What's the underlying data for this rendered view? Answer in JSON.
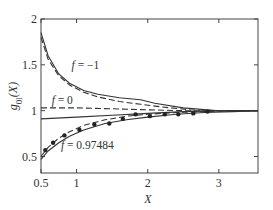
{
  "chart_data": {
    "type": "line",
    "title": "",
    "xlabel": "X",
    "ylabel": "g_{0l}(X)",
    "xlim": [
      0.5,
      3.55
    ],
    "ylim": [
      0.32,
      2.0
    ],
    "xticks": [
      0.5,
      1,
      2,
      3
    ],
    "xtick_labels": [
      "0.5",
      "1",
      "2",
      "3"
    ],
    "yticks": [
      0.5,
      1,
      1.5,
      2
    ],
    "ytick_labels": [
      "0.5",
      "1",
      "1.5",
      "2"
    ],
    "grid": false,
    "legend": "none",
    "annotations": [
      {
        "text": "f = −1",
        "x": 0.93,
        "y": 1.45
      },
      {
        "text": "f = 0",
        "x": 0.65,
        "y": 1.07
      },
      {
        "text": "f = 0.97484",
        "x": 0.78,
        "y": 0.58
      }
    ],
    "series": [
      {
        "name": "f=-1 solid",
        "style": "solid",
        "x": [
          0.5,
          0.6,
          0.75,
          0.9,
          1.1,
          1.3,
          1.6,
          1.9,
          2.1,
          2.5,
          3.0,
          3.55
        ],
        "y": [
          1.85,
          1.6,
          1.4,
          1.3,
          1.22,
          1.18,
          1.14,
          1.12,
          1.08,
          1.03,
          1.0,
          1.0
        ]
      },
      {
        "name": "f=-1 dashed",
        "style": "dashed",
        "x": [
          0.5,
          0.6,
          0.75,
          0.9,
          1.1,
          1.3,
          1.6,
          1.9,
          2.2,
          2.6,
          3.0,
          3.55
        ],
        "y": [
          1.8,
          1.56,
          1.38,
          1.28,
          1.2,
          1.15,
          1.1,
          1.07,
          1.04,
          1.01,
          1.0,
          1.0
        ]
      },
      {
        "name": "f=0 dashed",
        "style": "dashed",
        "x": [
          0.5,
          1.0,
          1.5,
          2.0,
          2.5,
          3.0,
          3.55
        ],
        "y": [
          1.03,
          1.03,
          1.02,
          1.01,
          1.0,
          1.0,
          1.0
        ]
      },
      {
        "name": "f=0 solid",
        "style": "solid",
        "x": [
          0.5,
          1.0,
          1.5,
          2.0,
          2.5,
          3.0,
          3.55
        ],
        "y": [
          0.91,
          0.93,
          0.95,
          0.97,
          0.99,
          1.0,
          1.0
        ]
      },
      {
        "name": "f=0.97484 dashed",
        "style": "dashed",
        "x": [
          0.5,
          0.6,
          0.75,
          0.9,
          1.1,
          1.4,
          1.7,
          2.0,
          2.4,
          2.8,
          3.2,
          3.55
        ],
        "y": [
          0.5,
          0.6,
          0.7,
          0.77,
          0.84,
          0.9,
          0.94,
          0.96,
          0.98,
          0.99,
          1.0,
          1.0
        ]
      },
      {
        "name": "f=0.97484 solid",
        "style": "solid",
        "x": [
          0.5,
          0.6,
          0.75,
          0.9,
          1.1,
          1.4,
          1.7,
          2.0,
          2.4,
          2.8,
          3.2,
          3.55
        ],
        "y": [
          0.47,
          0.56,
          0.65,
          0.72,
          0.79,
          0.86,
          0.9,
          0.93,
          0.96,
          0.98,
          0.99,
          1.0
        ]
      },
      {
        "name": "f=0.97484 simulation",
        "style": "markers",
        "x": [
          0.56,
          0.67,
          0.83,
          1.04,
          1.25,
          1.46,
          1.65,
          1.83,
          2.03,
          2.24,
          2.43,
          2.64,
          2.84
        ],
        "y": [
          0.57,
          0.65,
          0.73,
          0.79,
          0.85,
          0.86,
          0.91,
          0.96,
          0.94,
          0.96,
          0.96,
          0.97,
          0.99
        ]
      }
    ]
  },
  "labels": {
    "xlabel": "X",
    "ylabel_main": "g",
    "ylabel_sub": "0l",
    "ylabel_arg": "(X)"
  }
}
